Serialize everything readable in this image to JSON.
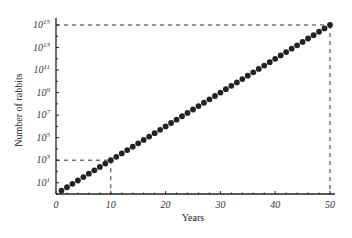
{
  "chart_data": {
    "type": "scatter",
    "title": "",
    "xlabel": "Years",
    "ylabel": "Number of rabbits",
    "yscale": "log",
    "xlim": [
      0,
      50
    ],
    "ylim_exp": [
      0,
      15
    ],
    "x_ticks": [
      "0",
      "10",
      "20",
      "30",
      "40",
      "50"
    ],
    "y_ticks": [
      {
        "base": "10",
        "exp": "1"
      },
      {
        "base": "10",
        "exp": "3"
      },
      {
        "base": "10",
        "exp": "5"
      },
      {
        "base": "10",
        "exp": "7"
      },
      {
        "base": "10",
        "exp": "9"
      },
      {
        "base": "10",
        "exp": "11"
      },
      {
        "base": "10",
        "exp": "13"
      },
      {
        "base": "10",
        "exp": "15"
      }
    ],
    "series": [
      {
        "name": "rabbits",
        "x_start": 1,
        "x_end": 50,
        "step": 1,
        "log10_y_at_x0": 0,
        "log10_y_per_year": 0.3
      }
    ],
    "annotations": [
      {
        "type": "dashed-guide",
        "x": 10,
        "y_label": "10^3"
      },
      {
        "type": "dashed-guide",
        "x": 50,
        "y_label": "10^15"
      }
    ],
    "grid": false,
    "legend": "none"
  }
}
